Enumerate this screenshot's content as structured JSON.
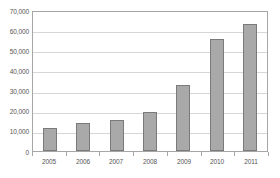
{
  "chart_data": {
    "type": "bar",
    "title": "",
    "subtitle": "",
    "xlabel": "",
    "ylabel": "",
    "categories": [
      "2005",
      "2006",
      "2007",
      "2008",
      "2009",
      "2010",
      "2011"
    ],
    "values": [
      11300,
      13700,
      15200,
      19500,
      32800,
      55600,
      63200
    ],
    "ylim": [
      0,
      70000
    ],
    "ytick_values": [
      0,
      10000,
      20000,
      30000,
      40000,
      50000,
      60000,
      70000
    ],
    "ytick_labels": [
      "0",
      "10,000",
      "20,000",
      "30,000",
      "40,000",
      "50,000",
      "60,000",
      "70,000"
    ],
    "grid": true,
    "grid_axis": "y",
    "legend": false,
    "legend_position": "none",
    "bar_color": "#a9a9a9",
    "bar_border_color": "#7a7a7a",
    "gridline_color": "#d6d6d6",
    "axis_color": "#a6a6a6",
    "text_color": "#555555"
  }
}
